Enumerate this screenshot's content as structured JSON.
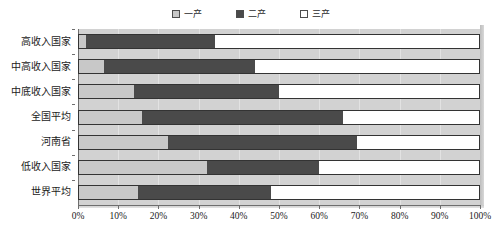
{
  "chart_data": {
    "type": "bar",
    "orientation": "horizontal",
    "stacked": true,
    "normalized_percent": true,
    "title": "",
    "subtitle": "",
    "xlabel": "",
    "ylabel": "",
    "xlim": [
      0,
      100
    ],
    "xtick_labels": [
      "0%",
      "10%",
      "20%",
      "30%",
      "40%",
      "50%",
      "60%",
      "70%",
      "80%",
      "90%",
      "100%"
    ],
    "xtick_values": [
      0,
      10,
      20,
      30,
      40,
      50,
      60,
      70,
      80,
      90,
      100
    ],
    "grid": "vertical",
    "legend_position": "top-center",
    "categories": [
      "高收入国家",
      "中高收入国家",
      "中底收入国家",
      "全国平均",
      "河南省",
      "低收入国家",
      "世界平均"
    ],
    "series": [
      {
        "name": "一产",
        "color": "#c8c8c8",
        "values": [
          2,
          6.5,
          14,
          16,
          22.5,
          32,
          15
        ]
      },
      {
        "name": "二产",
        "color": "#4a4a4a",
        "values": [
          32,
          37.5,
          36,
          50,
          47,
          28,
          33
        ]
      },
      {
        "name": "三产",
        "color": "#ffffff",
        "values": [
          66,
          56,
          50,
          34,
          30.5,
          40,
          52
        ]
      }
    ]
  },
  "legend": {
    "items": [
      {
        "label": "一产",
        "icon": "square-swatch-icon",
        "color": "#c8c8c8"
      },
      {
        "label": "二产",
        "icon": "square-swatch-icon",
        "color": "#4a4a4a"
      },
      {
        "label": "三产",
        "icon": "square-swatch-icon",
        "color": "#ffffff"
      }
    ]
  },
  "colors": {
    "plot_background": "#d2d2d2",
    "gridline": "#e2e2e2",
    "axis": "#6e6e6e",
    "bar_border": "#333333",
    "text": "#1a1a1a"
  }
}
